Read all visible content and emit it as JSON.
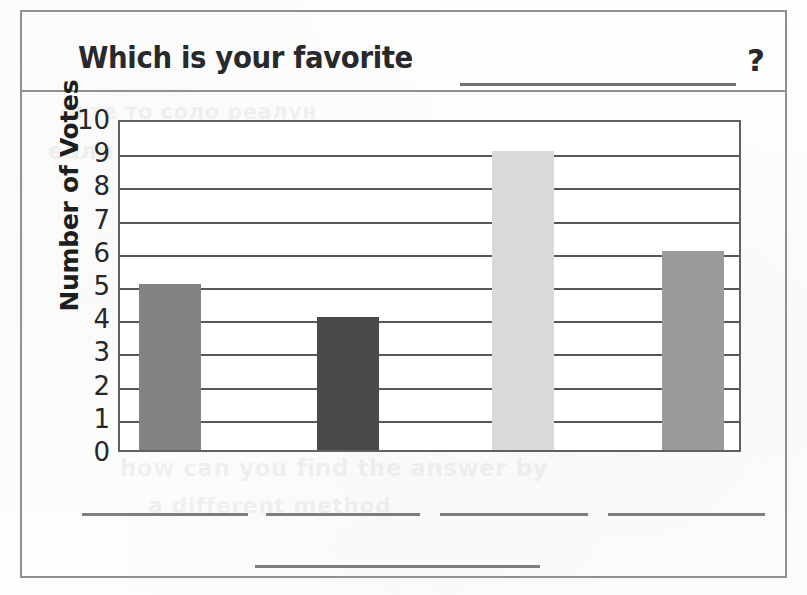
{
  "worksheet": {
    "question_prefix": "Which is your favorite",
    "question_blank": "",
    "question_suffix": "?"
  },
  "bleed_through": {
    "line1": "оите то соло реалун",
    "line2": "еали тене лиен тус рема",
    "line3": "how can you find the answer by",
    "line4": "a different method",
    "line5": "using the graph"
  },
  "chart_data": {
    "type": "bar",
    "xlabel": "",
    "ylabel": "Number of Votes",
    "ylim": [
      0,
      10
    ],
    "ytick_labels": [
      "10",
      "9",
      "8",
      "7",
      "6",
      "5",
      "4",
      "3",
      "2",
      "1",
      "0"
    ],
    "ytick_values": [
      10,
      9,
      8,
      7,
      6,
      5,
      4,
      3,
      2,
      1,
      0
    ],
    "grid": true,
    "grid_axis": "y",
    "legend": false,
    "categories": [
      "",
      "",
      "",
      ""
    ],
    "values": [
      5,
      4,
      9,
      6
    ],
    "bar_colors": [
      "#838383",
      "#494949",
      "#d9d9d9",
      "#9b9b9b"
    ],
    "bar_positions_px": [
      {
        "left": 19,
        "width": 62
      },
      {
        "left": 197,
        "width": 62
      },
      {
        "left": 372,
        "width": 62
      },
      {
        "left": 542,
        "width": 62
      }
    ]
  },
  "category_blanks": [
    {
      "left": 82,
      "width": 166
    },
    {
      "left": 266,
      "width": 154
    },
    {
      "left": 440,
      "width": 148
    },
    {
      "left": 608,
      "width": 157
    }
  ],
  "colors": {
    "frame": "#8e9093",
    "axis": "#5e6164",
    "grid": "#55585b",
    "text": "#26272a",
    "blank_line": "#7b7f83"
  }
}
